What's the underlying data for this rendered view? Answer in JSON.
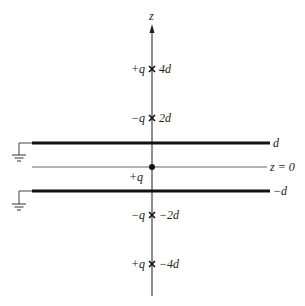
{
  "diagram": {
    "axis_label": "z",
    "plates": [
      {
        "name": "upper-plate",
        "label": "d",
        "grounded": true
      },
      {
        "name": "lower-plate",
        "label": "−d",
        "grounded": true
      }
    ],
    "midplane_label": "z = 0",
    "real_charge": {
      "label": "+q",
      "position": "z = 0"
    },
    "image_charges": [
      {
        "sign_label": "+q",
        "position_label": "4d"
      },
      {
        "sign_label": "−q",
        "position_label": "2d"
      },
      {
        "sign_label": "−q",
        "position_label": "−2d"
      },
      {
        "sign_label": "+q",
        "position_label": "−4d"
      }
    ]
  }
}
